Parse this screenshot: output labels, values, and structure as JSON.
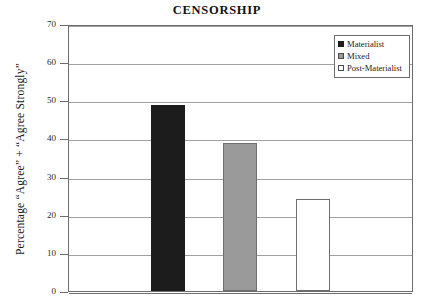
{
  "chart_data": {
    "type": "bar",
    "title": "CENSORSHIP",
    "xlabel": "",
    "ylabel": "Percentage “Agree” + “Agree Strongly”",
    "categories": [
      "Materialist",
      "Mixed",
      "Post-Materialist"
    ],
    "values": [
      48.8,
      38.8,
      24.0
    ],
    "ylim": [
      0,
      70
    ],
    "yticks": [
      0,
      10,
      20,
      30,
      40,
      50,
      60,
      70
    ],
    "ytick_labels": [
      "0",
      "10",
      "20",
      "30",
      "40",
      "50",
      "60",
      "70"
    ],
    "xticks": [],
    "xtick_labels": [],
    "grid": true,
    "legend_position": "top-right",
    "series": [
      {
        "name": "Materialist",
        "value": 48.8,
        "color": "#1c1c1c"
      },
      {
        "name": "Mixed",
        "value": 38.8,
        "color": "#9a9a9a"
      },
      {
        "name": "Post-Materialist",
        "value": 24.0,
        "color": "#ffffff"
      }
    ],
    "legend": [
      {
        "label": "Materialist",
        "swatch": "black-filled-square"
      },
      {
        "label": "Mixed",
        "swatch": "gray-filled-square"
      },
      {
        "label": "Post-Materialist",
        "swatch": "white-outline-square"
      }
    ]
  },
  "colors": {
    "materialist": "#1c1c1c",
    "mixed": "#9a9a9a",
    "post_materialist": "#ffffff",
    "frame": "#6d6d6d",
    "grid": "#a0a0a0",
    "text": "#1a1a1a",
    "background": "#ffffff"
  }
}
